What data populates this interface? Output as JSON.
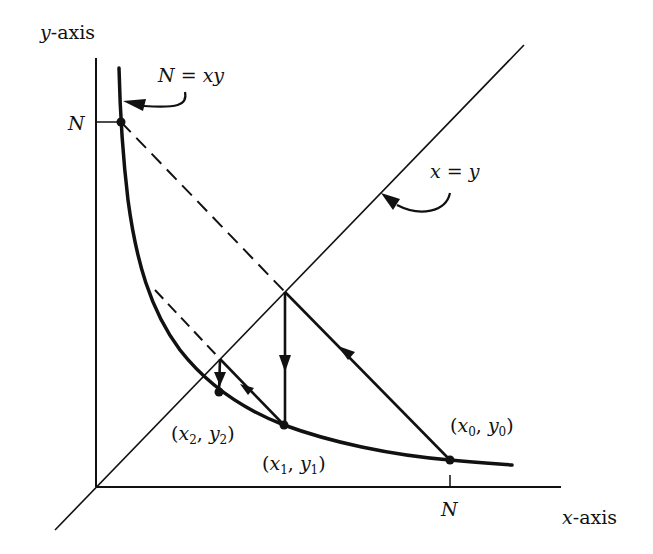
{
  "diagram": {
    "type": "geometric-iteration-diagram",
    "axes": {
      "y_label_var": "y",
      "y_label_suffix": "-axis",
      "x_label_var": "x",
      "x_label_suffix": "-axis",
      "y_tick_label": "N",
      "x_tick_label": "N"
    },
    "curves": {
      "hyperbola_label_left": "N",
      "hyperbola_label_eq": " = ",
      "hyperbola_label_right": "xy",
      "diagonal_label_left": "x",
      "diagonal_label_eq": " = ",
      "diagonal_label_right": "y"
    },
    "points": [
      {
        "name": "x0y0",
        "x_var": "x",
        "x_sub": "0",
        "y_var": "y",
        "y_sub": "0"
      },
      {
        "name": "x1y1",
        "x_var": "x",
        "x_sub": "1",
        "y_var": "y",
        "y_sub": "1"
      },
      {
        "name": "x2y2",
        "x_var": "x",
        "x_sub": "2",
        "y_var": "y",
        "y_sub": "2"
      }
    ],
    "punct": {
      "open": "(",
      "comma": ", ",
      "close": ")"
    },
    "colors": {
      "ink": "#111111",
      "background": "#ffffff"
    }
  }
}
